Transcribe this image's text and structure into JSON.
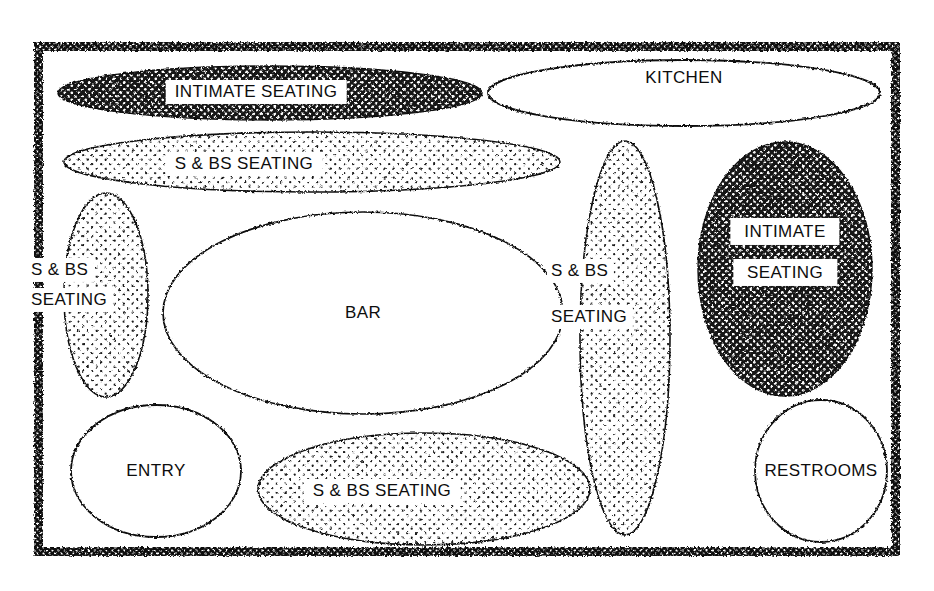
{
  "diagram": {
    "type": "bubble-diagram",
    "canvas": {
      "width": 934,
      "height": 591
    },
    "colors": {
      "ink": "#111111",
      "paper": "#ffffff",
      "dark_fill": "#141414",
      "dark_dot": "#ffffff",
      "light_fill": "#ffffff",
      "light_dot": "#1a1a1a"
    },
    "border": {
      "name": "site-boundary",
      "style": "thick stippled black band",
      "x": 34,
      "y": 42,
      "width": 866,
      "height": 514,
      "thickness": 9
    },
    "zones": [
      {
        "id": "intimate-seating-top",
        "label": "INTIMATE SEATING",
        "lines": [
          "INTIMATE SEATING"
        ],
        "fill": "dark",
        "shape": "ellipse",
        "cx": 270,
        "cy": 93,
        "rx": 212,
        "ry": 27,
        "label_x": 256,
        "label_y": 92,
        "label_size": 17
      },
      {
        "id": "kitchen",
        "label": "KITCHEN",
        "lines": [
          "KITCHEN"
        ],
        "fill": "none",
        "shape": "ellipse",
        "cx": 684,
        "cy": 93,
        "rx": 196,
        "ry": 33,
        "label_x": 684,
        "label_y": 78,
        "label_size": 17
      },
      {
        "id": "s-bs-seating-top",
        "label": "S & BS SEATING",
        "lines": [
          "S & BS SEATING"
        ],
        "fill": "light",
        "shape": "ellipse",
        "cx": 312,
        "cy": 162,
        "rx": 248,
        "ry": 30,
        "label_x": 244,
        "label_y": 164,
        "label_size": 17
      },
      {
        "id": "s-bs-seating-left",
        "label": "S & BS SEATING",
        "lines": [
          "S & BS",
          "SEATING"
        ],
        "fill": "light",
        "shape": "ellipse",
        "cx": 106,
        "cy": 295,
        "rx": 42,
        "ry": 102,
        "label_x": 70,
        "label_y": 285,
        "label_size": 17
      },
      {
        "id": "bar",
        "label": "BAR",
        "lines": [
          "BAR"
        ],
        "fill": "none",
        "shape": "ellipse",
        "cx": 363,
        "cy": 313,
        "rx": 200,
        "ry": 101,
        "label_x": 363,
        "label_y": 313,
        "label_size": 17
      },
      {
        "id": "s-bs-seating-right",
        "label": "S & BS SEATING",
        "lines": [
          "S & BS",
          "SEATING"
        ],
        "fill": "light",
        "shape": "ellipse",
        "cx": 625,
        "cy": 338,
        "rx": 45,
        "ry": 197,
        "label_x": 590,
        "label_y": 294,
        "label_size": 17
      },
      {
        "id": "intimate-seating-right",
        "label": "INTIMATE SEATING",
        "lines": [
          "INTIMATE",
          "SEATING"
        ],
        "fill": "dark",
        "shape": "ellipse",
        "cx": 785,
        "cy": 269,
        "rx": 87,
        "ry": 127,
        "label_x": 785,
        "label_y": 252,
        "label_size": 17
      },
      {
        "id": "entry",
        "label": "ENTRY",
        "lines": [
          "ENTRY"
        ],
        "fill": "none",
        "shape": "ellipse",
        "cx": 156,
        "cy": 471,
        "rx": 85,
        "ry": 66,
        "label_x": 156,
        "label_y": 471,
        "label_size": 17
      },
      {
        "id": "s-bs-seating-bottom",
        "label": "S & BS SEATING",
        "lines": [
          "S & BS SEATING"
        ],
        "fill": "light",
        "shape": "ellipse",
        "cx": 424,
        "cy": 489,
        "rx": 166,
        "ry": 56,
        "label_x": 382,
        "label_y": 491,
        "label_size": 17
      },
      {
        "id": "restrooms",
        "label": "RESTROOMS",
        "lines": [
          "RESTROOMS"
        ],
        "fill": "none",
        "shape": "ellipse",
        "cx": 821,
        "cy": 471,
        "rx": 66,
        "ry": 71,
        "label_x": 821,
        "label_y": 471,
        "label_size": 17
      }
    ]
  }
}
